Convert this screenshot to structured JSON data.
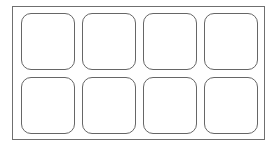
{
  "grid": {
    "rows": 2,
    "columns": 4,
    "tiles": [
      {
        "row": 1,
        "col": 1,
        "label": ""
      },
      {
        "row": 1,
        "col": 2,
        "label": ""
      },
      {
        "row": 1,
        "col": 3,
        "label": ""
      },
      {
        "row": 1,
        "col": 4,
        "label": ""
      },
      {
        "row": 2,
        "col": 1,
        "label": ""
      },
      {
        "row": 2,
        "col": 2,
        "label": ""
      },
      {
        "row": 2,
        "col": 3,
        "label": ""
      },
      {
        "row": 2,
        "col": 4,
        "label": ""
      }
    ]
  },
  "colors": {
    "frame_border": "#6f6f6f",
    "tile_border": "#666666",
    "background": "#ffffff"
  }
}
